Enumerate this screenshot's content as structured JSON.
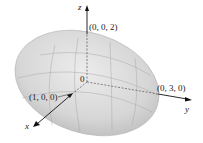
{
  "figure": {
    "type": "ellipsoid",
    "equation_semi_axes": {
      "a": 1,
      "b": 3,
      "c": 2
    },
    "fill_color": "#d9d9d9",
    "grid_color": "#a8a8a8",
    "axis_color": "#111111"
  },
  "axes": {
    "x": {
      "label": "x"
    },
    "y": {
      "label": "y"
    },
    "z": {
      "label": "z"
    }
  },
  "points": {
    "origin": "0",
    "x_intercept": "(1, 0, 0)",
    "y_intercept": "(0, 3, 0)",
    "z_intercept": "(0, 0, 2)"
  }
}
